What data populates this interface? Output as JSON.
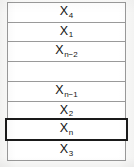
{
  "figure": {
    "type": "vertical-array-diagram",
    "cells": [
      {
        "base": "X",
        "sub": "4",
        "label": "X4",
        "highlighted": false,
        "empty": false
      },
      {
        "base": "X",
        "sub": "1",
        "label": "X1",
        "highlighted": false,
        "empty": false
      },
      {
        "base": "X",
        "sub": "n−2",
        "label": "Xn−2",
        "highlighted": false,
        "empty": false
      },
      {
        "base": "",
        "sub": "",
        "label": "",
        "highlighted": false,
        "empty": true
      },
      {
        "base": "X",
        "sub": "n−1",
        "label": "Xn−1",
        "highlighted": false,
        "empty": false
      },
      {
        "base": "X",
        "sub": "2",
        "label": "X2",
        "highlighted": false,
        "empty": false
      },
      {
        "base": "X",
        "sub": "n",
        "label": "Xn",
        "highlighted": true,
        "empty": false
      },
      {
        "base": "X",
        "sub": "3",
        "label": "X3",
        "highlighted": false,
        "empty": false
      }
    ],
    "caption": "",
    "colors": {
      "cell_border": "#9a9a9a",
      "highlight_border": "#1a1a1a",
      "cell_fill": "#ffffff",
      "page_background": "#fbfbfa",
      "text": "#141414"
    }
  }
}
